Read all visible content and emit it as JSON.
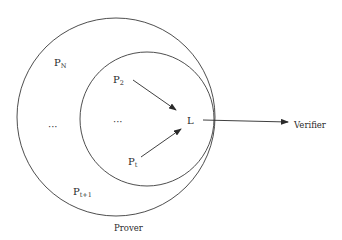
{
  "diagram": {
    "type": "nested-set-diagram",
    "colors": {
      "stroke": "#3a3a3a",
      "text": "#2a2a2a",
      "background": "#ffffff"
    },
    "outer_set": {
      "label": "Prover",
      "center": [
        116,
        117
      ],
      "radius": 99
    },
    "inner_set": {
      "center": [
        147,
        119
      ],
      "radius": 67
    },
    "nodes": {
      "pn": {
        "base": "P",
        "sub": "N"
      },
      "p2": {
        "base": "P",
        "sub": "2"
      },
      "pt": {
        "base": "P",
        "sub": "t"
      },
      "pt1": {
        "base": "P",
        "sub": "t+1"
      },
      "l": {
        "label": "L"
      },
      "ellipsis_outer": "···",
      "ellipsis_inner": "···"
    },
    "verifier_label": "Verifier",
    "prover_label": "Prover",
    "edges": [
      {
        "from": "P2",
        "to": "L"
      },
      {
        "from": "Pt",
        "to": "L"
      },
      {
        "from": "L",
        "to": "Verifier"
      }
    ]
  }
}
